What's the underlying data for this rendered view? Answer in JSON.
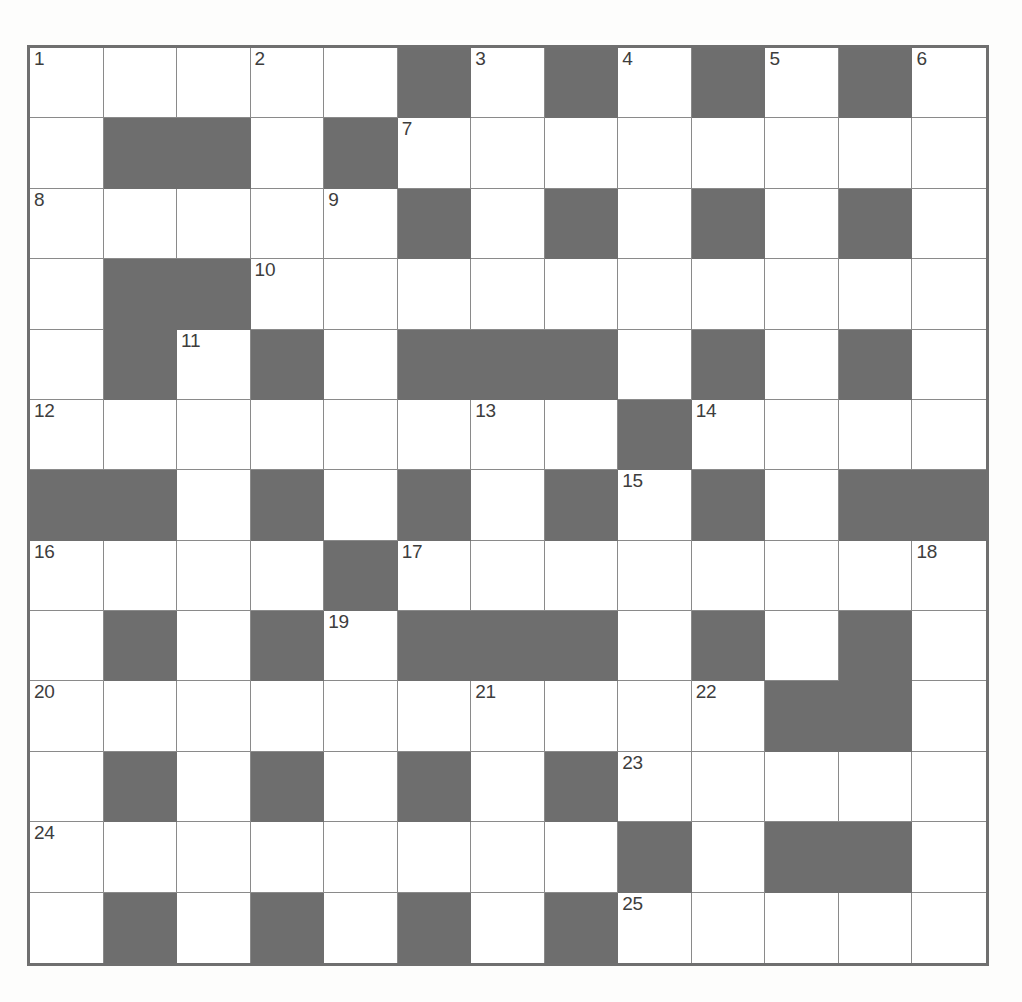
{
  "puzzle": {
    "title": "Crossword Grid",
    "type": "crossword",
    "rows": 13,
    "columns": 13,
    "colors": {
      "blocked_cell": "#6e6e6e",
      "open_cell": "#ffffff",
      "grid_line": "#8a8a8a",
      "grid_border": "#6f6f6f",
      "number_text": "#3d3d3d",
      "page_background": "#fdfdfc"
    },
    "clue_numbers_visible": [
      1,
      2,
      3,
      4,
      5,
      6,
      7,
      8,
      9,
      10,
      11,
      12,
      13,
      14,
      15,
      16,
      17,
      18,
      19,
      20,
      21,
      22,
      23,
      24,
      25
    ],
    "grid": [
      [
        "open",
        "open",
        "open",
        "open",
        "open",
        "block",
        "open",
        "block",
        "open",
        "block",
        "open",
        "block",
        "open"
      ],
      [
        "open",
        "block",
        "block",
        "open",
        "block",
        "open",
        "open",
        "open",
        "open",
        "open",
        "open",
        "open",
        "open"
      ],
      [
        "open",
        "open",
        "open",
        "open",
        "open",
        "block",
        "open",
        "block",
        "open",
        "block",
        "open",
        "block",
        "open"
      ],
      [
        "open",
        "block",
        "block",
        "open",
        "open",
        "open",
        "open",
        "open",
        "open",
        "open",
        "open",
        "open",
        "open"
      ],
      [
        "open",
        "block",
        "open",
        "block",
        "open",
        "block",
        "block",
        "block",
        "open",
        "block",
        "open",
        "block",
        "open"
      ],
      [
        "open",
        "open",
        "open",
        "open",
        "open",
        "open",
        "open",
        "open",
        "block",
        "open",
        "open",
        "open",
        "open"
      ],
      [
        "block",
        "block",
        "open",
        "block",
        "open",
        "block",
        "open",
        "block",
        "open",
        "block",
        "open",
        "block",
        "block"
      ],
      [
        "open",
        "open",
        "open",
        "open",
        "block",
        "open",
        "open",
        "open",
        "open",
        "open",
        "open",
        "open",
        "open"
      ],
      [
        "open",
        "block",
        "open",
        "block",
        "open",
        "block",
        "block",
        "block",
        "open",
        "block",
        "open",
        "block",
        "open"
      ],
      [
        "open",
        "open",
        "open",
        "open",
        "open",
        "open",
        "open",
        "open",
        "open",
        "open",
        "block",
        "block",
        "open"
      ],
      [
        "open",
        "block",
        "open",
        "block",
        "open",
        "block",
        "open",
        "block",
        "open",
        "open",
        "open",
        "open",
        "open"
      ],
      [
        "open",
        "open",
        "open",
        "open",
        "open",
        "open",
        "open",
        "open",
        "block",
        "open",
        "block",
        "block",
        "open"
      ],
      [
        "open",
        "block",
        "open",
        "block",
        "open",
        "block",
        "open",
        "block",
        "open",
        "open",
        "open",
        "open",
        "open"
      ]
    ],
    "numbers": [
      {
        "number": 1,
        "row": 1,
        "col": 1
      },
      {
        "number": 2,
        "row": 1,
        "col": 4
      },
      {
        "number": 3,
        "row": 1,
        "col": 7
      },
      {
        "number": 4,
        "row": 1,
        "col": 9
      },
      {
        "number": 5,
        "row": 1,
        "col": 11
      },
      {
        "number": 6,
        "row": 1,
        "col": 13
      },
      {
        "number": 7,
        "row": 2,
        "col": 6
      },
      {
        "number": 8,
        "row": 3,
        "col": 1
      },
      {
        "number": 9,
        "row": 3,
        "col": 5
      },
      {
        "number": 10,
        "row": 4,
        "col": 4
      },
      {
        "number": 11,
        "row": 5,
        "col": 3
      },
      {
        "number": 12,
        "row": 6,
        "col": 1
      },
      {
        "number": 13,
        "row": 6,
        "col": 7
      },
      {
        "number": 14,
        "row": 6,
        "col": 10
      },
      {
        "number": 15,
        "row": 7,
        "col": 9
      },
      {
        "number": 16,
        "row": 8,
        "col": 1
      },
      {
        "number": 17,
        "row": 8,
        "col": 6
      },
      {
        "number": 18,
        "row": 8,
        "col": 13
      },
      {
        "number": 19,
        "row": 9,
        "col": 5
      },
      {
        "number": 20,
        "row": 10,
        "col": 1
      },
      {
        "number": 21,
        "row": 10,
        "col": 7
      },
      {
        "number": 22,
        "row": 10,
        "col": 10
      },
      {
        "number": 23,
        "row": 11,
        "col": 9
      },
      {
        "number": 24,
        "row": 12,
        "col": 1
      },
      {
        "number": 25,
        "row": 13,
        "col": 9
      }
    ],
    "entries": []
  }
}
